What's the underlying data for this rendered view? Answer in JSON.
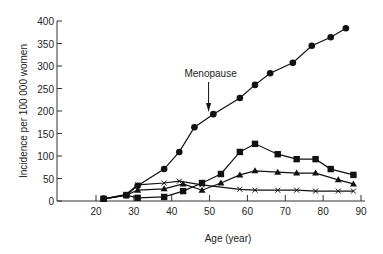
{
  "chart_data": {
    "type": "line",
    "title": "",
    "xlabel": "Age (year)",
    "ylabel": "Incidence per 100 000 women",
    "xlim": [
      10,
      90
    ],
    "ylim": [
      0,
      400
    ],
    "xticks": [
      20,
      30,
      40,
      50,
      60,
      70,
      80,
      90
    ],
    "yticks": [
      0,
      50,
      100,
      150,
      200,
      250,
      300,
      350,
      400
    ],
    "grid": false,
    "legend": null,
    "annotations": [
      {
        "text": "Menopause",
        "x": 50,
        "y": 265,
        "arrow_to": {
          "x": 50,
          "y": 205
        }
      }
    ],
    "series": [
      {
        "name": "circle",
        "marker": "circle",
        "x": [
          22,
          28,
          31,
          38,
          42,
          46,
          51,
          58,
          62,
          66,
          72,
          77,
          82,
          86
        ],
        "values": [
          5,
          13,
          34,
          71,
          109,
          164,
          193,
          229,
          258,
          284,
          307,
          345,
          364,
          384
        ]
      },
      {
        "name": "square",
        "marker": "square",
        "x": [
          22,
          28,
          31,
          38,
          43,
          48,
          53,
          58,
          62,
          68,
          73,
          78,
          82,
          88
        ],
        "values": [
          5,
          13,
          7,
          9,
          22,
          40,
          60,
          109,
          127,
          104,
          93,
          93,
          71,
          58
        ]
      },
      {
        "name": "triangle",
        "marker": "triangle",
        "x": [
          22,
          28,
          31,
          38,
          43,
          48,
          53,
          58,
          62,
          68,
          73,
          78,
          84,
          88
        ],
        "values": [
          5,
          13,
          24,
          27,
          38,
          24,
          40,
          58,
          67,
          64,
          62,
          62,
          47,
          38
        ]
      },
      {
        "name": "cross",
        "marker": "x",
        "x": [
          22,
          28,
          31,
          38,
          42,
          48,
          58,
          62,
          68,
          73,
          78,
          84,
          88
        ],
        "values": [
          5,
          15,
          36,
          40,
          44,
          36,
          26,
          24,
          24,
          24,
          22,
          22,
          22
        ]
      }
    ]
  }
}
